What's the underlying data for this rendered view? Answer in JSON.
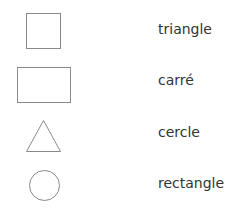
{
  "shapes": [
    {
      "name": "square",
      "stroke": "#888888"
    },
    {
      "name": "rectangle",
      "stroke": "#888888"
    },
    {
      "name": "triangle",
      "stroke": "#888888"
    },
    {
      "name": "circle",
      "stroke": "#888888"
    }
  ],
  "labels": [
    "triangle",
    "carré",
    "cercle",
    "rectangle"
  ]
}
